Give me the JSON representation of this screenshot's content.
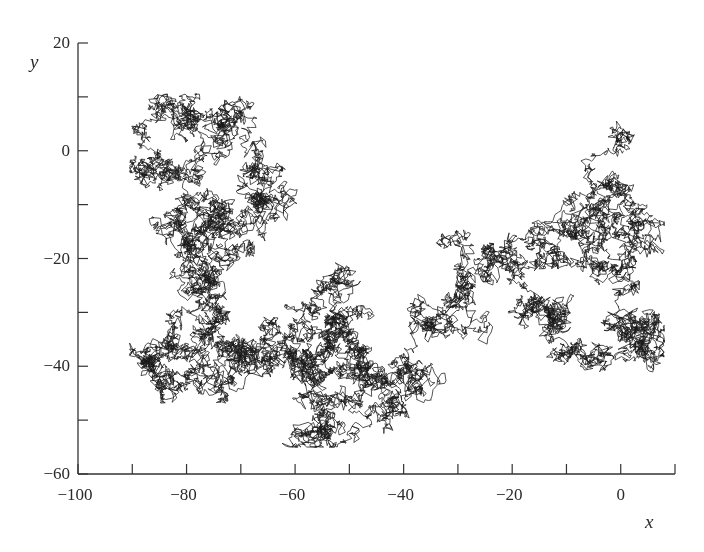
{
  "chart_data": {
    "type": "line",
    "subtype": "2d-random-walk-trajectory",
    "title": "",
    "xlabel": "x",
    "ylabel": "y",
    "xlim": [
      -100,
      10
    ],
    "ylim": [
      -60,
      20
    ],
    "x_ticks": [
      -100,
      -90,
      -80,
      -70,
      -60,
      -50,
      -40,
      -30,
      -20,
      -10,
      0,
      10
    ],
    "x_tick_labels": [
      {
        "value": -100,
        "label": "−100"
      },
      {
        "value": -80,
        "label": "−80"
      },
      {
        "value": -60,
        "label": "−60"
      },
      {
        "value": -40,
        "label": "−40"
      },
      {
        "value": -20,
        "label": "−20"
      },
      {
        "value": 0,
        "label": "0"
      }
    ],
    "y_ticks": [
      -60,
      -50,
      -40,
      -30,
      -20,
      -10,
      0,
      10,
      20
    ],
    "y_tick_labels": [
      {
        "value": 20,
        "label": "20"
      },
      {
        "value": 0,
        "label": "0"
      },
      {
        "value": -20,
        "label": "−20"
      },
      {
        "value": -40,
        "label": "−40"
      },
      {
        "value": -60,
        "label": "−60"
      }
    ],
    "grid": false,
    "legend": null,
    "tick_direction": "in",
    "line_color": "#1a1a1a",
    "start_point": {
      "x": 0.5,
      "y": 0
    },
    "approx_extent": {
      "x_min": -90,
      "x_max": 8,
      "y_min": -55,
      "y_max": 10
    },
    "path_waypoints": [
      {
        "x": 0.5,
        "y": 0
      },
      {
        "x": -2,
        "y": -6
      },
      {
        "x": -5,
        "y": -11
      },
      {
        "x": -9,
        "y": -15
      },
      {
        "x": -5,
        "y": -16
      },
      {
        "x": -1,
        "y": -12
      },
      {
        "x": 3,
        "y": -15
      },
      {
        "x": 6,
        "y": -18
      },
      {
        "x": 2,
        "y": -20
      },
      {
        "x": 0,
        "y": -26
      },
      {
        "x": 2,
        "y": -32
      },
      {
        "x": -1,
        "y": -33
      },
      {
        "x": 4,
        "y": -36
      },
      {
        "x": -3,
        "y": -38
      },
      {
        "x": -7,
        "y": -36
      },
      {
        "x": -10,
        "y": -38
      },
      {
        "x": -14,
        "y": -34
      },
      {
        "x": -13,
        "y": -28
      },
      {
        "x": -18,
        "y": -25
      },
      {
        "x": -14,
        "y": -20
      },
      {
        "x": -17,
        "y": -17
      },
      {
        "x": -22,
        "y": -18
      },
      {
        "x": -24,
        "y": -22
      },
      {
        "x": -29,
        "y": -24
      },
      {
        "x": -31,
        "y": -28
      },
      {
        "x": -35,
        "y": -33
      },
      {
        "x": -39,
        "y": -40
      },
      {
        "x": -42,
        "y": -46
      },
      {
        "x": -38,
        "y": -44
      },
      {
        "x": -44,
        "y": -42
      },
      {
        "x": -47,
        "y": -38
      },
      {
        "x": -50,
        "y": -46
      },
      {
        "x": -53,
        "y": -52
      },
      {
        "x": -58,
        "y": -52
      },
      {
        "x": -55,
        "y": -46
      },
      {
        "x": -58,
        "y": -40
      },
      {
        "x": -55,
        "y": -34
      },
      {
        "x": -51,
        "y": -32
      },
      {
        "x": -48,
        "y": -30
      },
      {
        "x": -53,
        "y": -27
      },
      {
        "x": -58,
        "y": -29
      },
      {
        "x": -61,
        "y": -33
      },
      {
        "x": -59,
        "y": -38
      },
      {
        "x": -64,
        "y": -40
      },
      {
        "x": -68,
        "y": -36
      },
      {
        "x": -72,
        "y": -38
      },
      {
        "x": -76,
        "y": -34
      },
      {
        "x": -79,
        "y": -38
      },
      {
        "x": -84,
        "y": -36
      },
      {
        "x": -88,
        "y": -40
      },
      {
        "x": -84,
        "y": -43
      },
      {
        "x": -79,
        "y": -40
      },
      {
        "x": -75,
        "y": -44
      },
      {
        "x": -72,
        "y": -42
      },
      {
        "x": -70,
        "y": -36
      },
      {
        "x": -73,
        "y": -30
      },
      {
        "x": -79,
        "y": -27
      },
      {
        "x": -76,
        "y": -24
      },
      {
        "x": -73,
        "y": -20
      },
      {
        "x": -74,
        "y": -16
      },
      {
        "x": -78,
        "y": -12
      },
      {
        "x": -83,
        "y": -14
      },
      {
        "x": -80,
        "y": -18
      },
      {
        "x": -76,
        "y": -13
      },
      {
        "x": -73,
        "y": -10
      },
      {
        "x": -78,
        "y": -6
      },
      {
        "x": -82,
        "y": -4
      },
      {
        "x": -86,
        "y": -2
      },
      {
        "x": -88,
        "y": 4
      },
      {
        "x": -85,
        "y": 8
      },
      {
        "x": -80,
        "y": 6
      },
      {
        "x": -76,
        "y": 7
      },
      {
        "x": -73,
        "y": 5
      },
      {
        "x": -70,
        "y": 6
      },
      {
        "x": -69,
        "y": 2
      },
      {
        "x": -68,
        "y": -4
      },
      {
        "x": -66,
        "y": -9
      },
      {
        "x": -64,
        "y": -12
      },
      {
        "x": -66,
        "y": -15
      }
    ]
  }
}
